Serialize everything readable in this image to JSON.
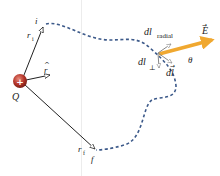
{
  "diagram": {
    "charge": {
      "label": "Q",
      "sign": "+",
      "color": "#b5352a"
    },
    "unit_vector": {
      "label": "r",
      "hat": "^"
    },
    "initial_point": {
      "label": "i",
      "vector_label": "r",
      "vector_sub": "i"
    },
    "final_point": {
      "label": "f",
      "vector_label": "r",
      "vector_sub": "f"
    },
    "path": {
      "style": "dashed",
      "color": "#3d5a8a"
    },
    "field": {
      "label": "E",
      "color": "#f0a830"
    },
    "angle": {
      "label": "θ"
    },
    "dl_radial": {
      "label": "dl",
      "sub": "radial"
    },
    "dl_perp": {
      "label": "dl",
      "sub": "⊥"
    },
    "dl": {
      "label": "dl"
    }
  }
}
